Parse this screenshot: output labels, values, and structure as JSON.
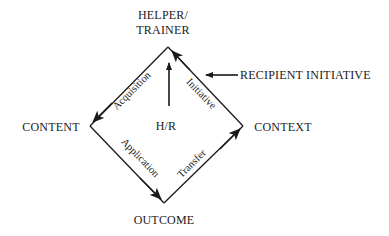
{
  "nodes": {
    "top_line1": "HELPER/",
    "top_line2": "TRAINER",
    "left": "CONTENT",
    "right": "CONTEXT",
    "bottom": "OUTCOME",
    "center": "H/R"
  },
  "edges": {
    "acquisition": "Acquisition",
    "initiative": "Initiative",
    "application": "Application",
    "transfer": "Transfer"
  },
  "external": {
    "recipient_initiative": "RECIPIENT INITIATIVE"
  },
  "colors": {
    "line": "#1a1a1a",
    "background": "#ffffff"
  }
}
